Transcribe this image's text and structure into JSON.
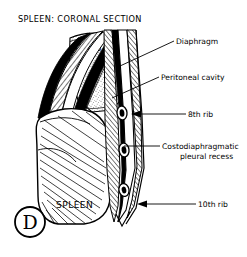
{
  "figure": {
    "title": "SPLEEN: CORONAL SECTION",
    "panel_letter": "D",
    "background_color": "#ffffff",
    "ink_color": "#000000"
  },
  "organ_labels": [
    {
      "name": "lung",
      "text": "LUNG"
    },
    {
      "name": "spleen",
      "text": "SPLEEN"
    }
  ],
  "callouts": [
    {
      "name": "diaphragm",
      "text": "Diaphragm",
      "leader": "diagonal"
    },
    {
      "name": "peritoneal-cavity",
      "text": "Peritoneal cavity",
      "leader": "diagonal"
    },
    {
      "name": "eighth-rib",
      "text": "8th rib",
      "leader": "arrow"
    },
    {
      "name": "costodiaphragmatic-pleural-recess",
      "text": "Costodiaphragmatic",
      "text_line2": "pleural recess",
      "leader": "plain"
    },
    {
      "name": "tenth-rib",
      "text": "10th rib",
      "leader": "arrow"
    }
  ]
}
